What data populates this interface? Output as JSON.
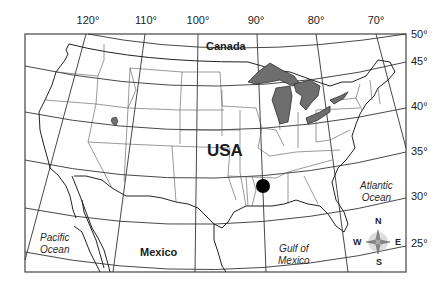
{
  "map": {
    "title": "USA",
    "longitude_labels": [
      {
        "label": "120°",
        "x": 88
      },
      {
        "label": "110°",
        "x": 146
      },
      {
        "label": "100°",
        "x": 198
      },
      {
        "label": "90°",
        "x": 256
      },
      {
        "label": "80°",
        "x": 316
      },
      {
        "label": "70°",
        "x": 376
      }
    ],
    "latitude_labels": [
      {
        "label": "50°",
        "y": 29
      },
      {
        "label": "45°",
        "y": 56
      },
      {
        "label": "40°",
        "y": 101
      },
      {
        "label": "35°",
        "y": 146
      },
      {
        "label": "30°",
        "y": 191
      },
      {
        "label": "25°",
        "y": 238
      }
    ],
    "regions": {
      "canada": "Canada",
      "usa": "USA",
      "mexico": "Mexico"
    },
    "water_bodies": {
      "pacific": [
        "Pacific",
        "Ocean"
      ],
      "atlantic": [
        "Atlantic",
        "Ocean"
      ],
      "gulf": [
        "Gulf of",
        "Mexico"
      ]
    },
    "compass": {
      "n": "N",
      "s": "S",
      "e": "E",
      "w": "W"
    },
    "marker": {
      "description": "location-dot",
      "x": 263,
      "y": 186
    },
    "colors": {
      "lakes": "#6e6e6e",
      "lines": "#333333",
      "frame": "#444444",
      "marker": "#000000"
    }
  }
}
